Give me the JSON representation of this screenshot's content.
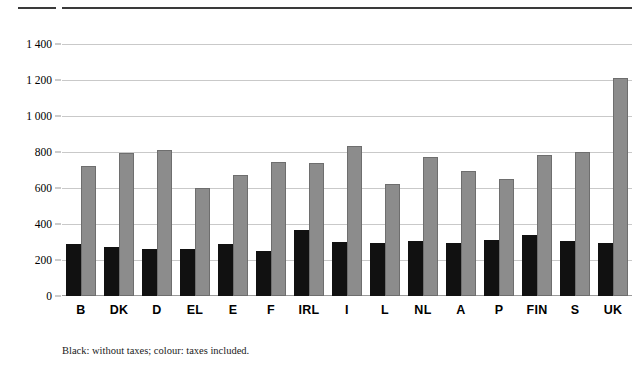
{
  "figure": {
    "footnote": "Black: without taxes; colour: taxes included.",
    "series_black_name": "without taxes",
    "series_grey_name": "taxes included",
    "color_black": "#111111",
    "color_grey": "#8c8c8c"
  },
  "chart_data": {
    "type": "bar",
    "title": "",
    "subtitle": "",
    "xlabel": "",
    "ylabel": "",
    "ylim": [
      0,
      1400
    ],
    "ytick_labels": [
      "1 400",
      "1 200",
      "1 000",
      "800",
      "600",
      "400",
      "200",
      "0"
    ],
    "ytick_values": [
      1400,
      1200,
      1000,
      800,
      600,
      400,
      200,
      0
    ],
    "grid": true,
    "legend": "none",
    "annotation": "Black: without taxes; colour: taxes included.",
    "categories": [
      "B",
      "DK",
      "D",
      "EL",
      "E",
      "F",
      "IRL",
      "I",
      "L",
      "NL",
      "A",
      "P",
      "FIN",
      "S",
      "UK"
    ],
    "series": [
      {
        "name": "without taxes",
        "color": "#111111",
        "values": [
          290,
          272,
          262,
          263,
          290,
          250,
          367,
          298,
          292,
          308,
          295,
          312,
          340,
          308,
          292
        ]
      },
      {
        "name": "taxes included",
        "color": "#8c8c8c",
        "values": [
          722,
          795,
          812,
          600,
          670,
          745,
          737,
          835,
          620,
          770,
          695,
          648,
          782,
          800,
          1211
        ]
      }
    ]
  }
}
